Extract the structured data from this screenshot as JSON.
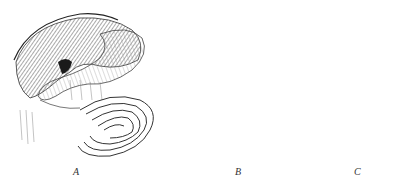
{
  "figure": {
    "panels": [
      {
        "id": "A",
        "label": "A",
        "subject": "stomach-and-small-intestine"
      },
      {
        "id": "B",
        "label": "B",
        "subject": "colon-and-mesentery"
      },
      {
        "id": "C",
        "label": "C",
        "subject": "stomach-and-duodenum-section"
      }
    ],
    "colors": {
      "ink": "#2a2a2a",
      "shade": "#7a7a7a",
      "light": "#d8d8d8",
      "background": "#ffffff"
    }
  }
}
